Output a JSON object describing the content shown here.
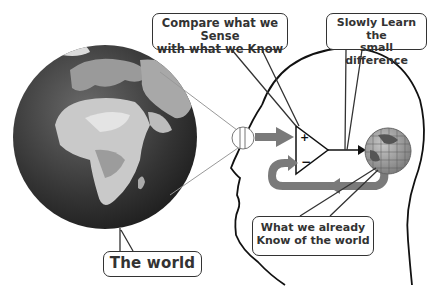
{
  "diagram": {
    "type": "concept-illustration",
    "callouts": {
      "compare": {
        "line1": "Compare what we Sense",
        "line2": "with what we Know"
      },
      "learn": {
        "line1": "Slowly Learn the",
        "line2": "small difference"
      },
      "know": {
        "line1": "What we already",
        "line2": "Know of the world"
      },
      "world": {
        "label": "The world"
      }
    },
    "comparator": {
      "plus_sign": "+",
      "minus_sign": "−"
    },
    "colors": {
      "outline": "#1a1a1a",
      "arrow_gray": "#7a7a7a",
      "globe_ocean": "#3a3a3a",
      "globe_land": "#bdbdbd",
      "callout_border": "#333333",
      "text": "#333333"
    }
  }
}
